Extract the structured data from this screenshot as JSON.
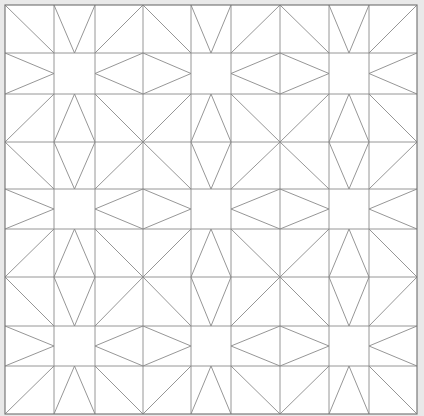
{
  "colors": {
    "background": "#e9e9e9",
    "fill": "#ffffff",
    "line": "#8a8a8a",
    "border": "#7a7a7a"
  },
  "grid": {
    "columns": [
      5,
      54,
      95,
      143,
      191,
      231,
      280,
      329,
      369,
      417
    ],
    "rows": [
      5,
      53,
      94,
      142,
      189,
      229,
      277,
      326,
      366,
      414
    ],
    "narrow_columns": [
      1,
      4,
      7
    ],
    "narrow_rows": [
      1,
      4,
      7
    ]
  },
  "star_centers": [
    [
      1,
      1
    ],
    [
      4,
      1
    ],
    [
      7,
      1
    ],
    [
      1,
      4
    ],
    [
      4,
      4
    ],
    [
      7,
      4
    ],
    [
      1,
      7
    ],
    [
      4,
      7
    ],
    [
      7,
      7
    ]
  ],
  "line_width": 0.9
}
